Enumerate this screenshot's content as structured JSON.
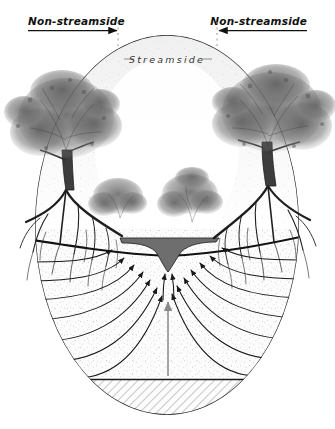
{
  "figure": {
    "type": "scientific-cross-section-illustration",
    "background_color": "#ffffff",
    "width": 335,
    "height": 429
  },
  "labels": {
    "left_zone": "Non-streamside",
    "right_zone": "Non-streamside",
    "center_zone": "Streamside"
  },
  "annotations": {
    "left_arrow": {
      "name": "left-extent-arrow",
      "direction": "right",
      "from_x": 28,
      "to_x": 118,
      "y": 28
    },
    "right_arrow": {
      "name": "right-extent-arrow",
      "direction": "left",
      "from_x": 307,
      "to_x": 217,
      "y": 28
    },
    "left_divider": {
      "name": "left-zone-divider",
      "x": 118,
      "y_top": 22,
      "y_bottom": 175,
      "style": "dotted"
    },
    "right_divider": {
      "name": "right-zone-divider",
      "x": 217,
      "y_top": 22,
      "y_bottom": 175,
      "style": "dotted"
    }
  },
  "colors": {
    "ink": "#1a1a1a",
    "soil_fill": "#fbfbfb",
    "stipple": "#8d8d8d",
    "channel_water": "#6e6e6e",
    "bedrock_hatch": "#9a9a9a",
    "flow_line": "#1a1a1a",
    "vertical_arrow": "#8a8a8a",
    "canopy": "#4a4a4a",
    "roots": "#222222"
  },
  "geometry": {
    "hillslope_oval": {
      "name": "hillslope-body",
      "cx": 167,
      "cy": 225,
      "rx": 132,
      "ry": 190,
      "description": "Ovoid cross-section of the hillslope / catchment"
    },
    "ground_surface_y": 228,
    "water_table": {
      "name": "water-table-line",
      "description": "Bold dark curve dipping toward the stream channel",
      "left_y": 240,
      "center_y": 250,
      "right_y": 238
    },
    "stream_channel": {
      "name": "stream-channel",
      "center_x": 168,
      "top_y": 242,
      "bottom_y": 272,
      "half_width": 46,
      "fill": "#6e6e6e"
    },
    "bedrock_line_y": 379,
    "bedrock_label": "hatched bedrock layer"
  },
  "flow": {
    "description": "Groundwater flow lines converging upward to the stream channel",
    "left_lines": 7,
    "right_lines": 7,
    "center_arrows": 2,
    "vertical_upwelling_arrow": {
      "name": "upwelling-arrow",
      "x": 168,
      "from_y": 375,
      "to_y": 300,
      "color": "#8a8a8a"
    }
  },
  "vegetation": {
    "left_tree": {
      "name": "left-canopy-tree",
      "cx": 68,
      "cy": 128,
      "scale": 1.0
    },
    "right_tree": {
      "name": "right-canopy-tree",
      "cx": 268,
      "cy": 122,
      "scale": 1.0
    },
    "left_shrub": {
      "name": "left-shrub",
      "cx": 118,
      "cy": 196,
      "scale": 0.55
    },
    "center_shrub": {
      "name": "center-shrub",
      "cx": 190,
      "cy": 196,
      "scale": 0.6
    },
    "root_systems": [
      "left-root-system",
      "right-root-system"
    ]
  }
}
